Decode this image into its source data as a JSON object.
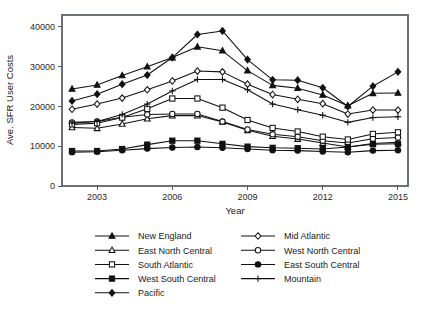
{
  "chart_data": {
    "type": "line",
    "title": "",
    "xlabel": "Year",
    "ylabel": "Ave. SFR User Costs",
    "xlim": [
      2001.6,
      2015.4
    ],
    "ylim": [
      0,
      43000
    ],
    "grid": false,
    "legend_position": "bottom",
    "x": [
      2002,
      2003,
      2004,
      2005,
      2006,
      2007,
      2008,
      2009,
      2010,
      2011,
      2012,
      2013,
      2014,
      2015
    ],
    "xticks": [
      2003,
      2006,
      2009,
      2012,
      2015
    ],
    "xtick_labels": [
      "2003",
      "2006",
      "2009",
      "2012",
      "2015"
    ],
    "yticks": [
      0,
      10000,
      20000,
      30000,
      40000
    ],
    "ytick_labels": [
      "0",
      "10000",
      "20000",
      "30000",
      "40000"
    ],
    "series": [
      {
        "name": "New England",
        "marker": "filled-triangle",
        "values": [
          24400,
          25400,
          27800,
          30000,
          32300,
          35000,
          34000,
          29000,
          25300,
          24600,
          22900,
          20200,
          23300,
          23400
        ]
      },
      {
        "name": "Mid Atlantic",
        "marker": "open-diamond",
        "values": [
          19300,
          20600,
          22100,
          24200,
          26400,
          28900,
          28700,
          25600,
          23000,
          21800,
          20700,
          18100,
          19100,
          19100
        ]
      },
      {
        "name": "East North Central",
        "marker": "open-triangle",
        "values": [
          14700,
          14500,
          15600,
          16900,
          17700,
          17700,
          16100,
          14000,
          12500,
          11800,
          10800,
          9800,
          10700,
          11000
        ]
      },
      {
        "name": "West North Central",
        "marker": "open-circle",
        "values": [
          16000,
          16200,
          17300,
          18000,
          18100,
          18100,
          16200,
          14200,
          13000,
          12400,
          11400,
          10800,
          11900,
          12200
        ]
      },
      {
        "name": "South Atlantic",
        "marker": "open-square",
        "values": [
          15500,
          15800,
          17200,
          19400,
          22000,
          22000,
          19700,
          16600,
          14600,
          13700,
          12400,
          11700,
          13100,
          13500
        ]
      },
      {
        "name": "East South Central",
        "marker": "filled-circle",
        "values": [
          8500,
          8600,
          9000,
          9400,
          9700,
          9800,
          9600,
          9300,
          9000,
          8900,
          8700,
          8500,
          8900,
          9000
        ]
      },
      {
        "name": "West South Central",
        "marker": "filled-square",
        "values": [
          8800,
          8800,
          9300,
          10400,
          11400,
          11400,
          10600,
          9900,
          9600,
          9500,
          9300,
          9800,
          10500,
          10600
        ]
      },
      {
        "name": "Mountain",
        "marker": "plus",
        "values": [
          15800,
          16200,
          18000,
          20600,
          23900,
          26800,
          26800,
          24200,
          20600,
          19200,
          17800,
          16000,
          17200,
          17400
        ]
      },
      {
        "name": "Pacific",
        "marker": "filled-diamond",
        "values": [
          21400,
          23100,
          25600,
          27900,
          32300,
          38100,
          39000,
          31800,
          26700,
          26600,
          24700,
          20000,
          25100,
          28700
        ]
      }
    ]
  },
  "legend": {
    "entries": [
      {
        "label": "New England",
        "marker": "filled-triangle"
      },
      {
        "label": "Mid Atlantic",
        "marker": "open-diamond"
      },
      {
        "label": "East North Central",
        "marker": "open-triangle"
      },
      {
        "label": "West North Central",
        "marker": "open-circle"
      },
      {
        "label": "South Atlantic",
        "marker": "open-square"
      },
      {
        "label": "East South Central",
        "marker": "filled-circle"
      },
      {
        "label": "West South Central",
        "marker": "filled-square"
      },
      {
        "label": "Mountain",
        "marker": "plus"
      },
      {
        "label": "Pacific",
        "marker": "filled-diamond"
      }
    ]
  },
  "colors": {
    "ink": "#111111",
    "axis": "#555b5e",
    "frame": "#6b7174",
    "background": "#ffffff"
  }
}
